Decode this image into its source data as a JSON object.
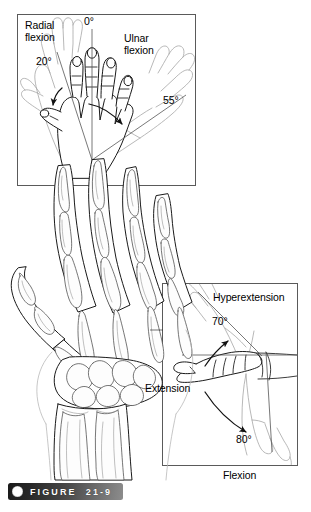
{
  "figure": {
    "caption_label": "FIGURE",
    "caption_number": "21-9",
    "bullet_icon": "filled-circle-icon",
    "background_color": "#ffffff",
    "ink_color": "#111111",
    "ghost_color": "#9a9a9a",
    "panel_border_color": "#555555"
  },
  "panels": {
    "top": {
      "name": "radial-ulnar-deviation-panel",
      "view": "dorsal view of right hand with overlaid ghosted positions",
      "bounds": {
        "x": 17,
        "y": 14,
        "width": 179,
        "height": 172
      },
      "labels": {
        "radial": "Radial\nflexion",
        "radial_line1": "Radial",
        "radial_line2": "flexion",
        "radial_angle": "20°",
        "neutral_angle": "0°",
        "ulnar_line1": "Ulnar",
        "ulnar_line2": "flexion",
        "ulnar_angle": "55°"
      }
    },
    "bottom_right": {
      "name": "flexion-extension-panel",
      "view": "lateral view of wrist and hand",
      "bounds": {
        "x": 162,
        "y": 283,
        "width": 136,
        "height": 183
      },
      "labels": {
        "hyperextension": "Hyperextension",
        "hyperextension_angle": "70°",
        "extension": "Extension",
        "flexion_angle": "80°",
        "flexion": "Flexion"
      }
    },
    "center": {
      "name": "hand-skeleton-illustration",
      "view": "dorsal radiographic line drawing of hand, wrist, radius and ulna",
      "bounds": {
        "x": 4,
        "y": 150,
        "width": 175,
        "height": 330
      }
    }
  },
  "measurements": [
    {
      "motion": "Radial flexion (radial deviation)",
      "value": 20,
      "unit": "degrees"
    },
    {
      "motion": "Neutral",
      "value": 0,
      "unit": "degrees"
    },
    {
      "motion": "Ulnar flexion (ulnar deviation)",
      "value": 55,
      "unit": "degrees"
    },
    {
      "motion": "Hyperextension",
      "value": 70,
      "unit": "degrees"
    },
    {
      "motion": "Flexion",
      "value": 80,
      "unit": "degrees"
    }
  ]
}
